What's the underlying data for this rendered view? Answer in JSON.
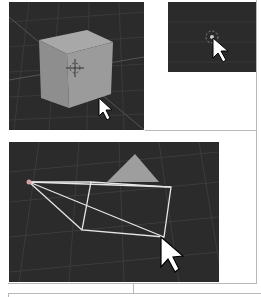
{
  "figure": {
    "panels": [
      {
        "id": "cube-select",
        "subject": "cube with origin marker and cursor"
      },
      {
        "id": "origin-click",
        "subject": "3D cursor click with pointer"
      },
      {
        "id": "camera-view",
        "subject": "camera wireframe with triangle and pointer"
      }
    ]
  },
  "colors": {
    "viewport_bg": "#2b2b2b",
    "grid": "#3a3a3a",
    "cube": "#9a9a9a",
    "wire": "#e8e8e8",
    "border": "#b8b8b8"
  }
}
